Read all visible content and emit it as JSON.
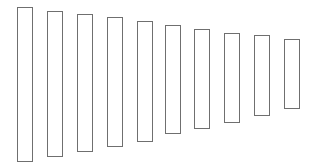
{
  "diagram": {
    "background": "#ffffff",
    "stroke_color": "#6f6f6f",
    "fill_color": "#ffffff",
    "shapes": [
      {
        "id": 1,
        "type": "rectangle",
        "x": 17,
        "y": 7,
        "width": 16,
        "height": 155
      },
      {
        "id": 2,
        "type": "rectangle",
        "x": 47,
        "y": 11,
        "width": 16,
        "height": 146
      },
      {
        "id": 3,
        "type": "rectangle",
        "x": 77,
        "y": 14,
        "width": 16,
        "height": 138
      },
      {
        "id": 4,
        "type": "rectangle",
        "x": 107,
        "y": 17,
        "width": 16,
        "height": 130
      },
      {
        "id": 5,
        "type": "rectangle",
        "x": 137,
        "y": 21,
        "width": 16,
        "height": 121
      },
      {
        "id": 6,
        "type": "rectangle",
        "x": 165,
        "y": 25,
        "width": 16,
        "height": 109
      },
      {
        "id": 7,
        "type": "rectangle",
        "x": 194,
        "y": 29,
        "width": 16,
        "height": 100
      },
      {
        "id": 8,
        "type": "rectangle",
        "x": 224,
        "y": 33,
        "width": 16,
        "height": 90
      },
      {
        "id": 9,
        "type": "rectangle",
        "x": 254,
        "y": 35,
        "width": 16,
        "height": 81
      },
      {
        "id": 10,
        "type": "rectangle",
        "x": 284,
        "y": 39,
        "width": 16,
        "height": 70
      }
    ]
  }
}
